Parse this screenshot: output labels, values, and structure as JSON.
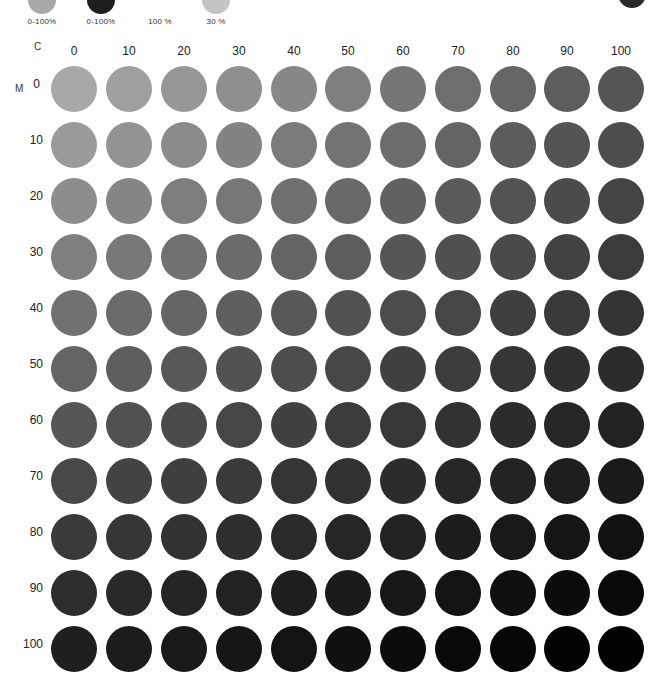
{
  "legend": {
    "items": [
      {
        "label": "0-100%",
        "color": "#a9a9a9",
        "cx": 42,
        "swatch_y": -14,
        "swatch_size": 28
      },
      {
        "label": "0-100%",
        "color": "#1e1e1e",
        "cx": 101,
        "swatch_y": -14,
        "swatch_size": 28
      },
      {
        "label": "100 %",
        "color": null,
        "cx": 160,
        "swatch_y": null,
        "swatch_size": 0
      },
      {
        "label": "30 %",
        "color": "#c4c4c4",
        "cx": 216,
        "swatch_y": -14,
        "swatch_size": 28
      }
    ],
    "corner_swatch": {
      "color": "#2a2a2a",
      "x": 632,
      "y": -20,
      "size": 28
    }
  },
  "chart_data": {
    "type": "heatmap",
    "title": "",
    "xlabel": "C",
    "ylabel": "M",
    "x": [
      0,
      10,
      20,
      30,
      40,
      50,
      60,
      70,
      80,
      90,
      100
    ],
    "y": [
      0,
      10,
      20,
      30,
      40,
      50,
      60,
      70,
      80,
      90,
      100
    ],
    "x_tick_labels": [
      "0",
      "10",
      "20",
      "30",
      "40",
      "50",
      "60",
      "70",
      "80",
      "90",
      "100"
    ],
    "y_tick_labels": [
      "0",
      "10",
      "20",
      "30",
      "40",
      "50",
      "60",
      "70",
      "80",
      "90",
      "100"
    ],
    "cell_shape": "circle",
    "value_description": "gray tone darkens with increasing C (left to right) and M (top to bottom)",
    "corner_colors": {
      "top_left": "#a8a8a8",
      "top_right": "#555555",
      "bottom_left": "#1f1f1f",
      "bottom_right": "#000000"
    },
    "legend_labels": [
      "0-100%",
      "0-100%",
      "100 %",
      "30 %"
    ],
    "grid": false
  },
  "layout": {
    "col_x": [
      74,
      129,
      184,
      239,
      294,
      348,
      403,
      458,
      513,
      567,
      621
    ],
    "row_y": [
      89,
      145,
      201,
      257,
      313,
      369,
      425,
      481,
      537,
      593,
      649
    ],
    "c_letter": {
      "text": "C",
      "x": 34,
      "y": 41
    },
    "m_letter": {
      "text": "M",
      "x": 15,
      "y": 83
    }
  }
}
